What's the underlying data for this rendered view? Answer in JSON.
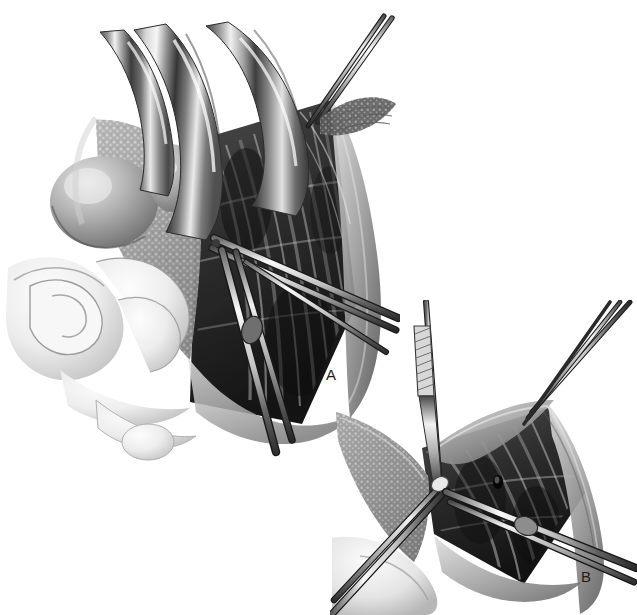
{
  "figure": {
    "kind": "medical-surgical-illustration",
    "technique": "graphite / airbrush grayscale rendering",
    "background_color": "#ffffff",
    "ink_color": "#1d1d1d",
    "width": 637,
    "height": 615,
    "panel_count": 2
  },
  "labels": {
    "panel_a": "A",
    "panel_b": "B"
  },
  "panels": [
    {
      "id": "a",
      "label": "A",
      "caption_position": "lower-right of panel",
      "depicts": "Deep surgical field exposed by three curved retractor blades; fascia incised and held by a clamp at the apex, forceps and a hemostat working within striated muscle fibers, with bowel loops displaced to the lower left.",
      "elements": [
        "retractor-blade-left",
        "retractor-blade-center",
        "retractor-blade-right",
        "tissue-clamp-apex",
        "fascia-sheet",
        "muscle-fiber-bed",
        "forceps-upper",
        "hemostat-lower",
        "bowel-loops",
        "round-organ-mass"
      ]
    },
    {
      "id": "b",
      "label": "B",
      "caption_position": "lower-right of panel",
      "depicts": "Close-up of the same dissection: a scalpel held vertically incises tissue tented by a fine forceps, while a second forceps from the upper right elevates the fascial edge over the exposed muscle bed.",
      "elements": [
        "scalpel-vertical",
        "forceps-upper-right",
        "forceps-lower-left",
        "fascia-sheet",
        "muscle-fiber-bed",
        "tissue-edge-left",
        "tissue-edge-right"
      ]
    }
  ],
  "palette": {
    "paper": "#ffffff",
    "highlight": "#f4f4f4",
    "light_gray": "#d6d6d6",
    "mid_gray": "#9a9a9a",
    "deep_gray": "#5e5e5e",
    "shadow": "#343434",
    "darkest": "#171717",
    "steel_light": "#ededed",
    "steel_mid": "#b3b3b3",
    "steel_dark": "#4a4a4a"
  }
}
